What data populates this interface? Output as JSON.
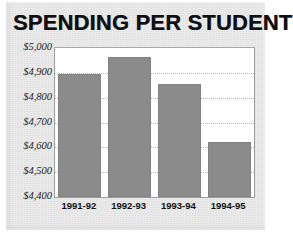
{
  "chart_data": {
    "type": "bar",
    "title": "SPENDING PER STUDENT",
    "xlabel": "",
    "ylabel": "",
    "categories": [
      "1991-92",
      "1992-93",
      "1993-94",
      "1994-95"
    ],
    "values": [
      4895,
      4965,
      4855,
      4620
    ],
    "ylim": [
      4400,
      5000
    ],
    "ytick_labels": [
      "$5,000",
      "$4,900",
      "$4,800",
      "$4,700",
      "$4,600",
      "$4,500",
      "$4,400"
    ],
    "ytick_values": [
      5000,
      4900,
      4800,
      4700,
      4600,
      4500,
      4400
    ],
    "grid": true,
    "legend": "none",
    "bar_color": "#8b8b8b",
    "plot_background": "#ffffff",
    "panel_background": "#ebebeb",
    "text_color": "#121212"
  }
}
